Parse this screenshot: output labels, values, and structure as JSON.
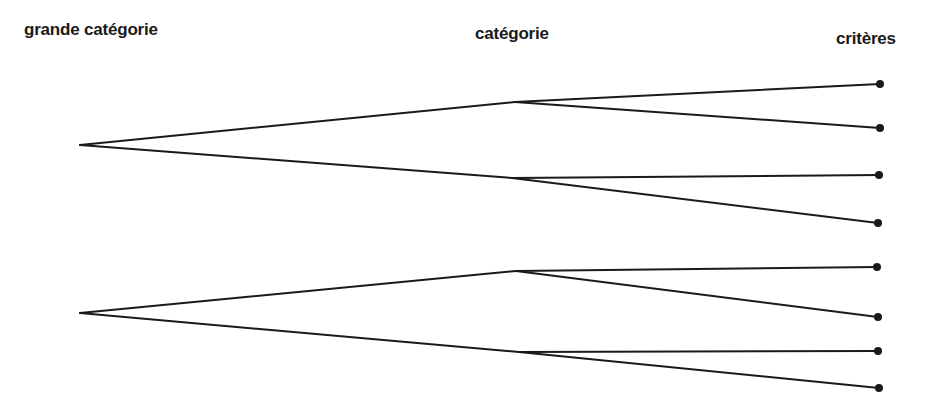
{
  "labels": {
    "level1": "grande catégorie",
    "level2": "catégorie",
    "level3": "critères"
  },
  "colors": {
    "ink": "#1a1a1a",
    "background": "#ffffff"
  },
  "tree": {
    "roots": [
      {
        "pos": [
          80,
          145
        ],
        "children": [
          {
            "pos": [
              515,
              102
            ],
            "leaves": [
              [
                880,
                84
              ],
              [
                880,
                128
              ]
            ]
          },
          {
            "pos": [
              512,
              178
            ],
            "leaves": [
              [
                879,
                175
              ],
              [
                878,
                223
              ]
            ]
          }
        ]
      },
      {
        "pos": [
          80,
          313
        ],
        "children": [
          {
            "pos": [
              516,
              271
            ],
            "leaves": [
              [
                877,
                267
              ],
              [
                878,
                317
              ]
            ]
          },
          {
            "pos": [
              519,
              352
            ],
            "leaves": [
              [
                878,
                351
              ],
              [
                879,
                388
              ]
            ]
          }
        ]
      }
    ]
  }
}
